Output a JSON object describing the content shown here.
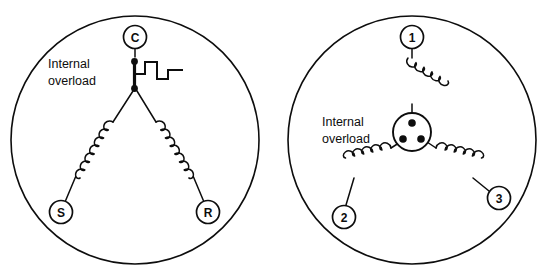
{
  "figure": {
    "background_color": "#ffffff",
    "line_color": "#0d0d0d",
    "width": 549,
    "height": 277
  },
  "diagrams": [
    {
      "id": "single-phase-motor",
      "annotation_line1": "Internal",
      "annotation_line2": "overload",
      "overload_symbol": "step-square-wave",
      "connection": "wye",
      "terminals": [
        {
          "label": "C",
          "name": "common",
          "position": "top"
        },
        {
          "label": "S",
          "name": "start",
          "position": "bottom-left"
        },
        {
          "label": "R",
          "name": "run",
          "position": "bottom-right"
        }
      ],
      "windings": 2,
      "node_dots": 2
    },
    {
      "id": "three-phase-motor",
      "annotation_line1": "Internal",
      "annotation_line2": "overload",
      "overload_symbol": "circular-protector-three-dots",
      "connection": "wye",
      "terminals": [
        {
          "label": "1",
          "name": "phase-1",
          "position": "top"
        },
        {
          "label": "2",
          "name": "phase-2",
          "position": "bottom-left"
        },
        {
          "label": "3",
          "name": "phase-3",
          "position": "bottom-right"
        }
      ],
      "windings": 3,
      "node_dots": 3
    }
  ]
}
